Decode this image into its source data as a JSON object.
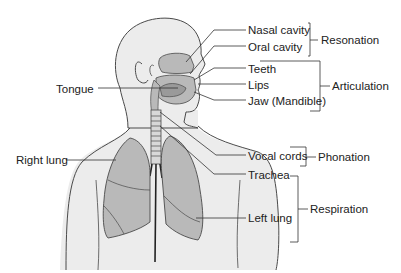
{
  "diagram": {
    "type": "anatomy",
    "colors": {
      "background": "#ffffff",
      "body_fill": "#ececec",
      "organ_fill": "#b9b9b9",
      "outline": "#4a4a4a",
      "leader_line": "#333333",
      "text": "#222222"
    },
    "labels": {
      "nasal_cavity": "Nasal cavity",
      "oral_cavity": "Oral cavity",
      "teeth": "Teeth",
      "lips": "Lips",
      "jaw": "Jaw (Mandible)",
      "tongue": "Tongue",
      "vocal_cords": "Vocal cords",
      "trachea": "Trachea",
      "right_lung": "Right lung",
      "left_lung": "Left lung"
    },
    "groups": {
      "resonation": "Resonation",
      "articulation": "Articulation",
      "phonation": "Phonation",
      "respiration": "Respiration"
    }
  }
}
